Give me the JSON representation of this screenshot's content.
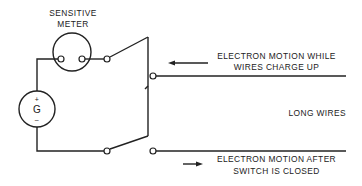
{
  "diagram": {
    "meter": {
      "label_line1": "SENSITIVE",
      "label_line2": "METER"
    },
    "galvanometer": {
      "symbol": "G",
      "plus": "+",
      "minus": "–"
    },
    "upper_label": {
      "line1": "ELECTRON MOTION WHILE",
      "line2": "WIRES CHARGE UP",
      "arrow_direction": "left"
    },
    "middle_label": "LONG WIRES",
    "lower_label": {
      "line1": "ELECTRON MOTION AFTER",
      "line2": "SWITCH IS CLOSED",
      "arrow_direction": "right"
    },
    "colors": {
      "ink": "#222222",
      "background": "#ffffff"
    }
  }
}
